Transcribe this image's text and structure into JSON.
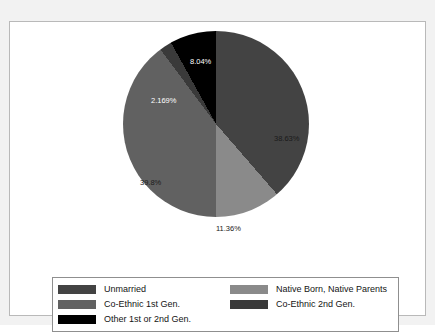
{
  "chart_data": {
    "type": "pie",
    "title": "",
    "labels": [
      "Unmarried",
      "Native Born, Native Parents",
      "Co-Ethnic 1st Gen.",
      "Co-Ethnic 2nd Gen.",
      "Other 1st or 2nd Gen."
    ],
    "values": [
      38.63,
      11.36,
      39.8,
      2.169,
      8.04
    ],
    "value_labels": [
      "38.63%",
      "11.36%",
      "39.8%",
      "2.169%",
      "8.04%"
    ],
    "colors": [
      "#434343",
      "#8a8a8a",
      "#616161",
      "#3a3a3a",
      "#000000"
    ],
    "label_colors": [
      "dark",
      "dark",
      "dark",
      "light",
      "light"
    ],
    "start_angle_deg": 0,
    "direction": "clockwise",
    "legend_position": "bottom",
    "grid": false
  },
  "slice_labels": [
    {
      "text": "38.63%",
      "color": "dark",
      "left": "151px",
      "top": "104px"
    },
    {
      "text": "11.36%",
      "color": "dark",
      "left": "93px",
      "top": "194px"
    },
    {
      "text": "39.8%",
      "color": "dark",
      "left": "17px",
      "top": "148px"
    },
    {
      "text": "2.169%",
      "color": "light",
      "left": "28px",
      "top": "66px"
    },
    {
      "text": "8.04%",
      "color": "light",
      "left": "67px",
      "top": "27px"
    }
  ],
  "legend": {
    "entries": [
      {
        "label": "Unmarried",
        "color": "#434343"
      },
      {
        "label": "Native Born, Native Parents",
        "color": "#8a8a8a"
      },
      {
        "label": "Co-Ethnic 1st Gen.",
        "color": "#616161"
      },
      {
        "label": "Co-Ethnic 2nd Gen.",
        "color": "#3a3a3a"
      },
      {
        "label": "Other 1st or 2nd Gen.",
        "color": "#000000"
      }
    ]
  },
  "theme": {
    "figure_background": "#f2f2f2",
    "panel_background": "#ffffff",
    "panel_border": "#b9b9b9",
    "legend_border": "#8f8f8f",
    "text_color": "#141414"
  }
}
